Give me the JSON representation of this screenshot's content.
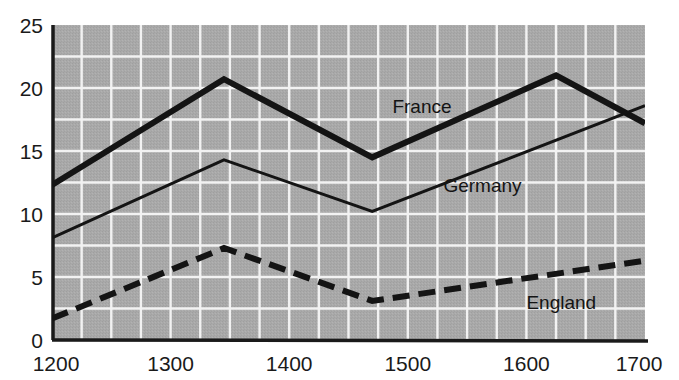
{
  "chart_data": {
    "type": "line",
    "title": "",
    "subtitle": "",
    "xlabel": "",
    "ylabel": "",
    "xlim": [
      1200,
      1700
    ],
    "ylim": [
      0,
      25
    ],
    "xticks": [
      "1200",
      "1300",
      "1400",
      "1500",
      "1600",
      "1700"
    ],
    "xtick_values": [
      1200,
      1300,
      1400,
      1500,
      1600,
      1700
    ],
    "yticks": [
      "0",
      "5",
      "10",
      "15",
      "20",
      "25"
    ],
    "ytick_values": [
      0,
      5,
      10,
      15,
      20,
      25
    ],
    "grid": true,
    "grid_x_step": 25,
    "grid_y_step": 2.5,
    "legend_position": "inline-annotations",
    "plot_background": "#a8a8a8",
    "grid_color": "#f2f2f2",
    "axis_color": "#1a1a1a",
    "line_color": "#141414",
    "x": [
      1200,
      1345,
      1470,
      1625,
      1700
    ],
    "series": [
      {
        "name": "France",
        "label": "France",
        "style": "solid",
        "width": 6,
        "x": [
          1200,
          1345,
          1470,
          1625,
          1700
        ],
        "values": [
          12.3,
          20.7,
          14.5,
          21.0,
          17.2
        ],
        "label_x": 1487,
        "label_y": 18.6
      },
      {
        "name": "Germany",
        "label": "Germany",
        "style": "solid",
        "width": 3,
        "x": [
          1200,
          1345,
          1470,
          1700
        ],
        "values": [
          8.1,
          14.3,
          10.2,
          18.6
        ],
        "label_x": 1530,
        "label_y": 12.3
      },
      {
        "name": "England",
        "label": "England",
        "style": "dashed",
        "width": 6,
        "x": [
          1200,
          1345,
          1470,
          1700
        ],
        "values": [
          1.7,
          7.3,
          3.1,
          6.3
        ],
        "label_x": 1600,
        "label_y": 3.0
      }
    ]
  }
}
